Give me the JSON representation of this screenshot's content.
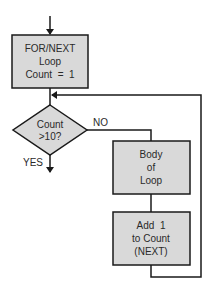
{
  "diagram": {
    "type": "flowchart",
    "colors": {
      "stroke": "#1a1a1a",
      "fill": "#d9d9d9",
      "text": "#2a2a2a",
      "background": "#ffffff"
    },
    "nodes": {
      "init": {
        "shape": "rectangle",
        "lines": [
          "FOR/NEXT",
          "Loop",
          "Count  =  1"
        ]
      },
      "decision": {
        "shape": "diamond",
        "lines": [
          "Count",
          ">10?"
        ]
      },
      "body": {
        "shape": "rectangle",
        "lines": [
          "Body",
          "of",
          "Loop"
        ]
      },
      "increment": {
        "shape": "rectangle",
        "lines": [
          "Add  1",
          "to Count",
          "(NEXT)"
        ]
      }
    },
    "edges": {
      "yes_label": "YES",
      "no_label": "NO"
    },
    "connections": [
      {
        "from": "entry",
        "to": "init"
      },
      {
        "from": "init",
        "to": "decision"
      },
      {
        "from": "decision",
        "to": "exit",
        "label": "YES"
      },
      {
        "from": "decision",
        "to": "body",
        "label": "NO"
      },
      {
        "from": "body",
        "to": "increment"
      },
      {
        "from": "increment",
        "to": "decision",
        "note": "loop back"
      }
    ]
  }
}
